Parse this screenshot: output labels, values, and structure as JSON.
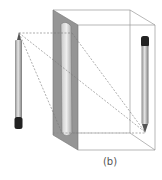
{
  "figure": {
    "caption": "(b)",
    "colors": {
      "lens_plane": "#8a8a8a",
      "lens_body": "#d8d8d8",
      "box_edges": "#9a9a9a",
      "rays": "#777777",
      "pencil_body": "#b8b8b8",
      "pencil_eraser": "#222222"
    },
    "objects": [
      {
        "name": "object-pencil",
        "orientation": "tip-up"
      },
      {
        "name": "lens-plane"
      },
      {
        "name": "image-box"
      },
      {
        "name": "image-pencil",
        "orientation": "tip-down"
      }
    ]
  }
}
